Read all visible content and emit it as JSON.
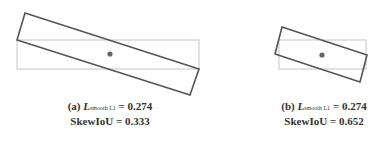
{
  "figure": {
    "panels": [
      {
        "label": "(a)",
        "loss_symbol": "L",
        "loss_subscript": "smooth L1",
        "loss_value": "= 0.274",
        "metric_label": "SkewIoU",
        "metric_value": "= 0.333"
      },
      {
        "label": "(b)",
        "loss_symbol": "L",
        "loss_subscript": "smooth L1",
        "loss_value": "= 0.274",
        "metric_label": "SkewIoU",
        "metric_value": "= 0.652"
      }
    ],
    "colors": {
      "rotated_box": "#555555",
      "reference_box": "#cccccc",
      "center_dot": "#666666"
    }
  }
}
